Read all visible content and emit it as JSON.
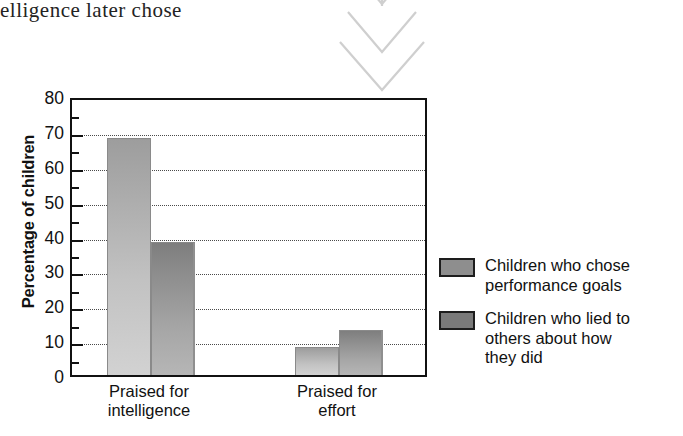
{
  "page_snippet": "elligence later chose",
  "pointer": {
    "icon": "triple-chevron-down-icon",
    "count": 3,
    "color": "#c9c9c9"
  },
  "chart_data": {
    "type": "bar",
    "title": "",
    "xlabel": "",
    "ylabel": "Percentage of children",
    "ylim": [
      0,
      80
    ],
    "ytick_step": 10,
    "yticks": [
      "0",
      "10",
      "20",
      "30",
      "40",
      "50",
      "60",
      "70",
      "80"
    ],
    "minor_tick_step": 5,
    "grid": true,
    "grid_style": "dotted-horizontal",
    "legend_position": "right",
    "categories": [
      "Praised for intelligence",
      "Praised for effort"
    ],
    "category_lines": [
      [
        "Praised for",
        "intelligence"
      ],
      [
        "Praised for",
        "effort"
      ]
    ],
    "series": [
      {
        "name": "Children who chose performance goals",
        "name_lines": [
          "Children who chose",
          "performance goals"
        ],
        "color": "#a8a8a8",
        "values": [
          68,
          8
        ]
      },
      {
        "name": "Children who lied to others about how they did",
        "name_lines": [
          "Children who lied to",
          "others about how",
          "they did"
        ],
        "color": "#8b8b8b",
        "values": [
          38,
          13
        ]
      }
    ]
  }
}
